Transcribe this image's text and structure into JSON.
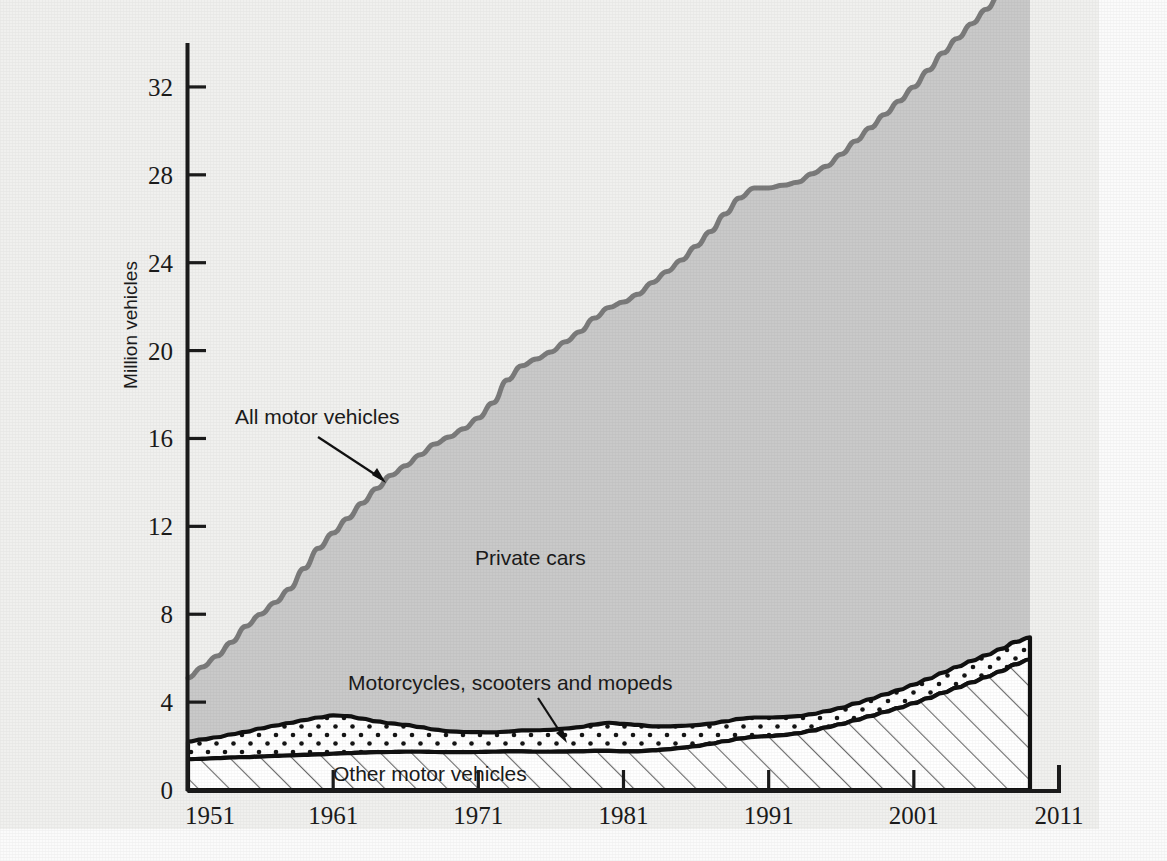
{
  "figure": {
    "background_color": "#f0f0ee",
    "paper_margin_color": "#fbfbfb"
  },
  "axes": {
    "y_title": "Million vehicles",
    "y_ticks": [
      "0",
      "4",
      "8",
      "12",
      "16",
      "20",
      "24",
      "28",
      "32"
    ],
    "x_ticks": [
      "1951",
      "1961",
      "1971",
      "1981",
      "1991",
      "2001",
      "2011"
    ]
  },
  "annotations": {
    "all_motor_vehicles": "All motor vehicles",
    "private_cars": "Private cars",
    "motorcycles": "Motorcycles, scooters and mopeds",
    "other_motor_vehicles": "Other motor vehicles"
  },
  "colors": {
    "total_line": "#7b7b7b",
    "private_cars_fill": "#c9c9c9",
    "band_outline": "#111111",
    "hatch_color": "#555555",
    "dot_color": "#111111",
    "axis_color": "#1b1b1b",
    "text_color": "#1b1b1b"
  },
  "chart_data": {
    "type": "area",
    "stacked": true,
    "title": "",
    "xlabel": "",
    "ylabel": "Million vehicles",
    "xlim": [
      1951,
      2011
    ],
    "ylim": [
      0,
      34
    ],
    "yticks": [
      0,
      4,
      8,
      12,
      16,
      20,
      24,
      28,
      32
    ],
    "xticks": [
      1951,
      1961,
      1971,
      1981,
      1991,
      2001,
      2011
    ],
    "grid": false,
    "legend": "inline-annotations",
    "data_ends_at": 2009,
    "x": [
      1951,
      1952,
      1953,
      1954,
      1955,
      1956,
      1957,
      1958,
      1959,
      1960,
      1961,
      1962,
      1963,
      1964,
      1965,
      1966,
      1967,
      1968,
      1969,
      1970,
      1971,
      1972,
      1973,
      1974,
      1975,
      1976,
      1977,
      1978,
      1979,
      1980,
      1981,
      1982,
      1983,
      1984,
      1985,
      1986,
      1987,
      1988,
      1989,
      1990,
      1991,
      1992,
      1993,
      1994,
      1995,
      1996,
      1997,
      1998,
      1999,
      2000,
      2001,
      2002,
      2003,
      2004,
      2005,
      2006,
      2007,
      2008,
      2009
    ],
    "series": [
      {
        "name": "Other motor vehicles",
        "pattern": "diagonal-hatch",
        "values": [
          1.4,
          1.42,
          1.45,
          1.48,
          1.5,
          1.52,
          1.55,
          1.57,
          1.6,
          1.62,
          1.65,
          1.68,
          1.7,
          1.72,
          1.73,
          1.74,
          1.74,
          1.73,
          1.72,
          1.72,
          1.73,
          1.74,
          1.76,
          1.76,
          1.74,
          1.74,
          1.75,
          1.76,
          1.78,
          1.78,
          1.76,
          1.76,
          1.8,
          1.85,
          1.92,
          2.0,
          2.1,
          2.22,
          2.34,
          2.42,
          2.45,
          2.5,
          2.58,
          2.7,
          2.85,
          3.0,
          3.18,
          3.36,
          3.55,
          3.74,
          3.95,
          4.18,
          4.42,
          4.66,
          4.9,
          5.14,
          5.4,
          5.72,
          5.95
        ]
      },
      {
        "name": "Motorcycles, scooters and mopeds",
        "pattern": "dotted",
        "values": [
          0.8,
          0.88,
          0.95,
          1.05,
          1.15,
          1.28,
          1.38,
          1.48,
          1.58,
          1.68,
          1.75,
          1.68,
          1.55,
          1.4,
          1.3,
          1.22,
          1.12,
          1.02,
          0.95,
          0.92,
          0.9,
          0.88,
          0.9,
          0.95,
          0.98,
          1.0,
          1.05,
          1.1,
          1.2,
          1.28,
          1.25,
          1.2,
          1.1,
          1.05,
          1.0,
          0.95,
          0.92,
          0.9,
          0.9,
          0.88,
          0.85,
          0.82,
          0.78,
          0.75,
          0.74,
          0.74,
          0.76,
          0.78,
          0.8,
          0.82,
          0.85,
          0.88,
          0.92,
          0.95,
          0.98,
          1.0,
          1.02,
          1.02,
          1.0
        ]
      },
      {
        "name": "Private cars",
        "pattern": "solid-gray",
        "values": [
          2.9,
          3.3,
          3.7,
          4.2,
          4.8,
          5.2,
          5.6,
          6.1,
          6.9,
          7.7,
          8.3,
          9.0,
          9.8,
          10.6,
          11.3,
          11.8,
          12.4,
          13.0,
          13.4,
          13.8,
          14.3,
          15.0,
          16.0,
          16.6,
          16.9,
          17.2,
          17.6,
          18.0,
          18.5,
          18.9,
          19.2,
          19.6,
          20.2,
          20.7,
          21.2,
          21.8,
          22.4,
          23.1,
          23.7,
          24.1,
          24.1,
          24.2,
          24.3,
          24.6,
          24.8,
          25.2,
          25.6,
          26.0,
          26.4,
          26.8,
          27.2,
          27.7,
          28.2,
          28.6,
          29.0,
          29.4,
          29.9,
          30.2,
          30.1
        ]
      }
    ],
    "total": {
      "name": "All motor vehicles",
      "values": [
        5.1,
        5.6,
        6.1,
        6.73,
        7.45,
        8.0,
        8.53,
        9.15,
        10.08,
        11.0,
        11.7,
        12.36,
        13.05,
        13.72,
        14.33,
        14.76,
        15.26,
        15.75,
        16.07,
        16.44,
        16.93,
        17.62,
        18.66,
        19.31,
        19.62,
        19.94,
        20.4,
        20.86,
        21.48,
        21.96,
        22.21,
        22.56,
        23.1,
        23.6,
        24.12,
        24.75,
        25.42,
        26.22,
        26.94,
        27.4,
        27.4,
        27.52,
        27.66,
        28.05,
        28.39,
        28.94,
        29.54,
        30.14,
        30.75,
        31.36,
        32.0,
        32.76,
        33.54,
        34.21,
        34.88,
        35.54,
        36.32,
        36.94,
        37.05
      ]
    }
  }
}
